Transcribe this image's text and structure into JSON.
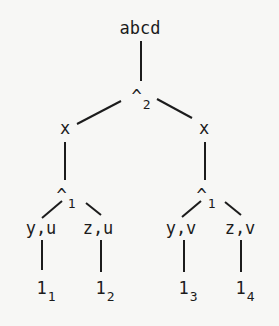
{
  "diagram": {
    "type": "tree",
    "nodes": {
      "root": {
        "label": "abcd",
        "x": 140,
        "y": 20
      },
      "meet2": {
        "label": "^",
        "sub": "2",
        "x": 141,
        "y": 88
      },
      "x_left": {
        "label": "x",
        "x": 65,
        "y": 120
      },
      "x_right": {
        "label": "x",
        "x": 204,
        "y": 120
      },
      "meet1_left": {
        "label": "^",
        "sub": "1",
        "x": 66,
        "y": 187
      },
      "meet1_right": {
        "label": "^",
        "sub": "1",
        "x": 206,
        "y": 187
      },
      "yu": {
        "label": "y,u",
        "x": 41,
        "y": 220
      },
      "zu": {
        "label": "z,u",
        "x": 98,
        "y": 220
      },
      "yv": {
        "label": "y,v",
        "x": 181,
        "y": 220
      },
      "zv": {
        "label": "z,v",
        "x": 240,
        "y": 220
      },
      "leaf1": {
        "label": "1",
        "sub": "1",
        "x": 46,
        "y": 280
      },
      "leaf2": {
        "label": "1",
        "sub": "2",
        "x": 105,
        "y": 280
      },
      "leaf3": {
        "label": "1",
        "sub": "3",
        "x": 188,
        "y": 280
      },
      "leaf4": {
        "label": "1",
        "sub": "4",
        "x": 245,
        "y": 280
      }
    },
    "edges": [
      {
        "from": "root",
        "to": "meet2",
        "x1": 141,
        "y1": 41,
        "x2": 141,
        "y2": 81
      },
      {
        "from": "meet2",
        "to": "x_left",
        "x1": 121,
        "y1": 101,
        "x2": 77,
        "y2": 124
      },
      {
        "from": "meet2",
        "to": "x_right",
        "x1": 157,
        "y1": 99,
        "x2": 192,
        "y2": 118
      },
      {
        "from": "x_left",
        "to": "meet1_left",
        "x1": 65,
        "y1": 142,
        "x2": 65,
        "y2": 180
      },
      {
        "from": "x_right",
        "to": "meet1_right",
        "x1": 205,
        "y1": 142,
        "x2": 205,
        "y2": 180
      },
      {
        "from": "meet1_left",
        "to": "yu",
        "x1": 62,
        "y1": 201,
        "x2": 42,
        "y2": 218
      },
      {
        "from": "meet1_left",
        "to": "zu",
        "x1": 86,
        "y1": 203,
        "x2": 101,
        "y2": 215
      },
      {
        "from": "meet1_right",
        "to": "yv",
        "x1": 201,
        "y1": 201,
        "x2": 182,
        "y2": 217
      },
      {
        "from": "meet1_right",
        "to": "zv",
        "x1": 225,
        "y1": 202,
        "x2": 241,
        "y2": 215
      },
      {
        "from": "yu",
        "to": "leaf1",
        "x1": 42,
        "y1": 240,
        "x2": 42,
        "y2": 270
      },
      {
        "from": "zu",
        "to": "leaf2",
        "x1": 101,
        "y1": 240,
        "x2": 101,
        "y2": 272
      },
      {
        "from": "yv",
        "to": "leaf3",
        "x1": 184,
        "y1": 240,
        "x2": 184,
        "y2": 272
      },
      {
        "from": "zv",
        "to": "leaf4",
        "x1": 241,
        "y1": 240,
        "x2": 241,
        "y2": 272
      }
    ]
  }
}
